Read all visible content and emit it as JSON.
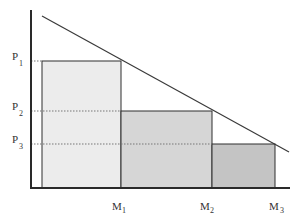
{
  "diagram": {
    "type": "price-discrimination-step-demand",
    "colors": {
      "axis": "#2a2a2a",
      "demand_line": "#3a3a3a",
      "bar1_fill": "#ececec",
      "bar2_fill": "#d6d6d6",
      "bar3_fill": "#c4c4c4",
      "bar_stroke": "#2e2e2e",
      "dotted": "#777777"
    },
    "y_labels": [
      {
        "main": "P",
        "sub": "1"
      },
      {
        "main": "P",
        "sub": "2"
      },
      {
        "main": "P",
        "sub": "3"
      }
    ],
    "x_labels": [
      {
        "main": "M",
        "sub": "1"
      },
      {
        "main": "M",
        "sub": "2"
      },
      {
        "main": "M",
        "sub": "3"
      }
    ],
    "bars": [
      {
        "name": "block-1",
        "from": "0",
        "to": "M1",
        "height": "P1"
      },
      {
        "name": "block-2",
        "from": "M1",
        "to": "M2",
        "height": "P2"
      },
      {
        "name": "block-3",
        "from": "M2",
        "to": "M3",
        "height": "P3"
      }
    ],
    "demand_line": {
      "label": ""
    }
  }
}
